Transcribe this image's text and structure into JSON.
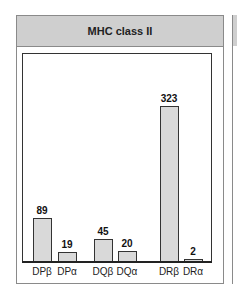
{
  "chart_data": {
    "type": "bar",
    "title": "MHC class II",
    "categories": [
      "DPβ",
      "DPα",
      "DQβ",
      "DQα",
      "DRβ",
      "DRα"
    ],
    "values": [
      89,
      19,
      45,
      20,
      323,
      2
    ],
    "xlabel": "",
    "ylabel": "",
    "ylim": [
      0,
      380
    ],
    "grid": false,
    "legend": "none",
    "bar_color": "#d9d9d9"
  },
  "panel": {
    "title": "MHC class II"
  }
}
